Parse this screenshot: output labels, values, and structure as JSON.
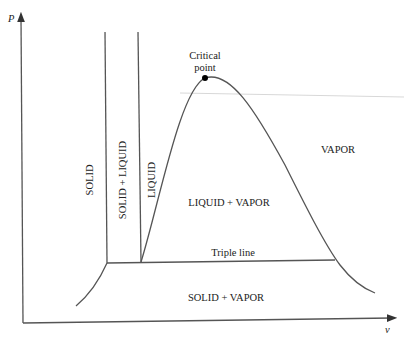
{
  "diagram": {
    "axes": {
      "y_label": "P",
      "x_label": "v"
    },
    "regions": {
      "solid": "SOLID",
      "solid_liquid": "SOLID + LIQUID",
      "liquid": "LIQUID",
      "liquid_vapor": "LIQUID + VAPOR",
      "vapor": "VAPOR",
      "solid_vapor": "SOLID + VAPOR"
    },
    "annotations": {
      "critical_point_line1": "Critical",
      "critical_point_line2": "point",
      "triple_line": "Triple line"
    },
    "colors": {
      "line": "#555555",
      "text": "#222222",
      "point": "#000000"
    }
  }
}
